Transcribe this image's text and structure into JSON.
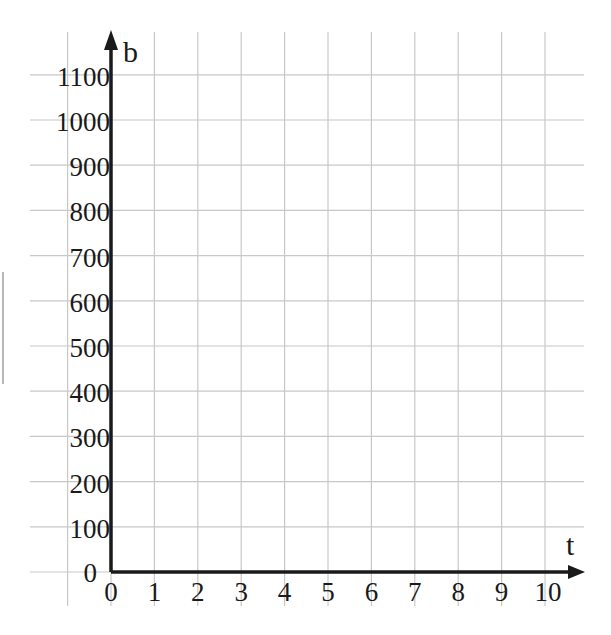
{
  "chart_data": {
    "type": "line",
    "title": "",
    "xlabel": "t",
    "ylabel": "b",
    "x_ticks": [
      "0",
      "1",
      "2",
      "3",
      "4",
      "5",
      "6",
      "7",
      "8",
      "9",
      "10"
    ],
    "y_ticks": [
      "0",
      "100",
      "200",
      "300",
      "400",
      "500",
      "600",
      "700",
      "800",
      "900",
      "1000",
      "1100"
    ],
    "xlim": [
      0,
      10
    ],
    "ylim": [
      0,
      1100
    ],
    "grid": true,
    "series": [],
    "legend": null
  },
  "colors": {
    "grid": "#c8c8c8",
    "axis": "#1a1a1a",
    "background": "#ffffff"
  }
}
